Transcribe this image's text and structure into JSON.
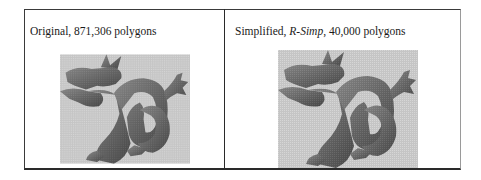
{
  "figure": {
    "panels": [
      {
        "caption_prefix": "Original, ",
        "caption_italic": "",
        "caption_suffix": "871,306 polygons",
        "image": "stanford-dragon-original",
        "polygons": 871306
      },
      {
        "caption_prefix": "Simplified, ",
        "caption_italic": "R-Simp",
        "caption_suffix": ", 40,000 polygons",
        "image": "stanford-dragon-simplified",
        "polygons": 40000
      }
    ],
    "colors": {
      "border": "#2a2a2a",
      "dragon_dark": "#3c3c3c",
      "dragon_mid": "#6e6e6e",
      "dragon_light": "#a5a5a5"
    }
  }
}
